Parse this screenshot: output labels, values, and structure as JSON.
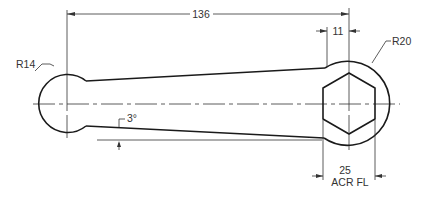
{
  "drawing": {
    "title": "Wrench / link arm mechanical drawing",
    "stroke_color": "#1a1a1a",
    "dimensions": {
      "center_distance": "136",
      "flat_offset": "11",
      "left_radius": "R14",
      "right_radius": "R20",
      "taper_angle": "3°",
      "hex_size": "25",
      "hex_note": "ACR FL"
    }
  }
}
